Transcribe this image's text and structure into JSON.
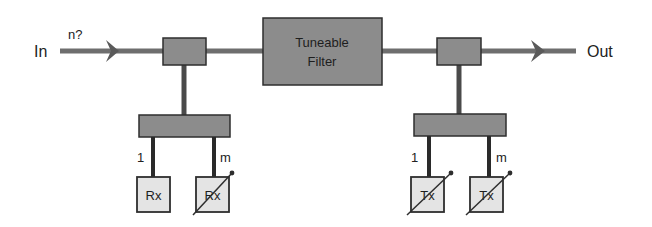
{
  "colors": {
    "line": "#6e6e6e",
    "box_fill": "#8c8c8c",
    "box_stroke": "#2e2e2e",
    "port_fill": "#e4e4e4",
    "text": "#222222"
  },
  "labels": {
    "input": "In",
    "input_channels": "n?",
    "output": "Out",
    "filter_line1": "Tuneable",
    "filter_line2": "Filter"
  },
  "drop_branch": {
    "ports": [
      {
        "index_label": "1",
        "label": "Rx",
        "tunable": false
      },
      {
        "index_label": "m",
        "label": "Rx",
        "tunable": true
      }
    ]
  },
  "add_branch": {
    "ports": [
      {
        "index_label": "1",
        "label": "Tx",
        "tunable": true
      },
      {
        "index_label": "m",
        "label": "Tx",
        "tunable": true
      }
    ]
  }
}
